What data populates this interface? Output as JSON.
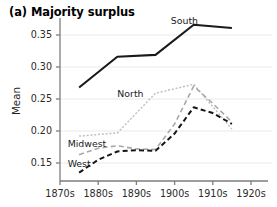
{
  "panel": {
    "title": "(a) Majority surplus"
  },
  "chart_data": {
    "type": "line",
    "title": "(a) Majority surplus",
    "xlabel": "",
    "ylabel": "Mean",
    "grid": true,
    "legend_position": "inline-annotations",
    "xtick_labels": [
      "1870s",
      "1880s",
      "1890s",
      "1900s",
      "1910s",
      "1920s"
    ],
    "xtick_values": [
      1870,
      1880,
      1890,
      1900,
      1910,
      1920
    ],
    "ytick_labels": [
      "0.15",
      "0.20",
      "0.25",
      "0.30",
      "0.35"
    ],
    "ytick_values": [
      0.15,
      0.2,
      0.25,
      0.3,
      0.35
    ],
    "xlim": [
      1867,
      1923
    ],
    "ylim": [
      0.128,
      0.375
    ],
    "series": [
      {
        "name": "South",
        "color": "#1a1a1a",
        "style": "solid",
        "width": 2.1,
        "x": [
          1875,
          1885,
          1895,
          1905,
          1915
        ],
        "values": [
          0.268,
          0.316,
          0.319,
          0.366,
          0.361
        ]
      },
      {
        "name": "North",
        "color": "#c0c0c0",
        "style": "dotted",
        "width": 1.5,
        "x": [
          1875,
          1885,
          1895,
          1905,
          1915
        ],
        "values": [
          0.192,
          0.197,
          0.259,
          0.273,
          0.203
        ]
      },
      {
        "name": "Midwest",
        "color": "#a8a8a8",
        "style": "dashed",
        "width": 1.6,
        "x": [
          1875,
          1880,
          1885,
          1890,
          1895,
          1900,
          1905,
          1910,
          1915
        ],
        "values": [
          0.163,
          0.173,
          0.177,
          0.172,
          0.171,
          0.211,
          0.27,
          0.243,
          0.214
        ]
      },
      {
        "name": "West",
        "color": "#161616",
        "style": "dashed",
        "width": 2.0,
        "x": [
          1875,
          1880,
          1885,
          1890,
          1895,
          1900,
          1905,
          1910,
          1915
        ],
        "values": [
          0.135,
          0.155,
          0.168,
          0.17,
          0.169,
          0.196,
          0.237,
          0.228,
          0.211
        ]
      }
    ],
    "annotations": [
      {
        "text": "South",
        "x": 1899,
        "y": 0.372
      },
      {
        "text": "North",
        "x": 1885,
        "y": 0.258
      },
      {
        "text": "Midwest",
        "x": 1872,
        "y": 0.18
      },
      {
        "text": "West",
        "x": 1872,
        "y": 0.149
      }
    ]
  }
}
